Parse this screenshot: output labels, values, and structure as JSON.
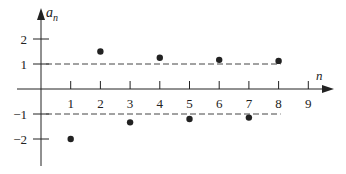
{
  "chart_data": {
    "type": "scatter",
    "title": "",
    "xlabel": "n",
    "ylabel": "a_n",
    "x_ticks": [
      "1",
      "2",
      "3",
      "4",
      "5",
      "6",
      "7",
      "8",
      "9"
    ],
    "y_ticks": [
      "2",
      "1",
      "-1",
      "-2"
    ],
    "xlim": [
      0,
      9.8
    ],
    "ylim": [
      -3,
      3.1
    ],
    "grid": false,
    "legend": null,
    "series": [
      {
        "name": "a_n",
        "x": [
          1,
          2,
          3,
          4,
          5,
          6,
          7,
          8
        ],
        "y": [
          -2.0,
          1.5,
          -1.333,
          1.25,
          -1.2,
          1.167,
          -1.143,
          1.125
        ]
      }
    ],
    "reference_lines": [
      {
        "y": 1,
        "style": "dashed",
        "x_range": [
          0,
          8
        ]
      },
      {
        "y": -1,
        "style": "dashed",
        "x_range": [
          0,
          8
        ]
      }
    ],
    "colors": {
      "axis": "#222222",
      "points": "#222222",
      "dashed": "#444444"
    }
  },
  "labels": {
    "y_axis": "a",
    "y_axis_sub": "n",
    "x_axis": "n"
  }
}
